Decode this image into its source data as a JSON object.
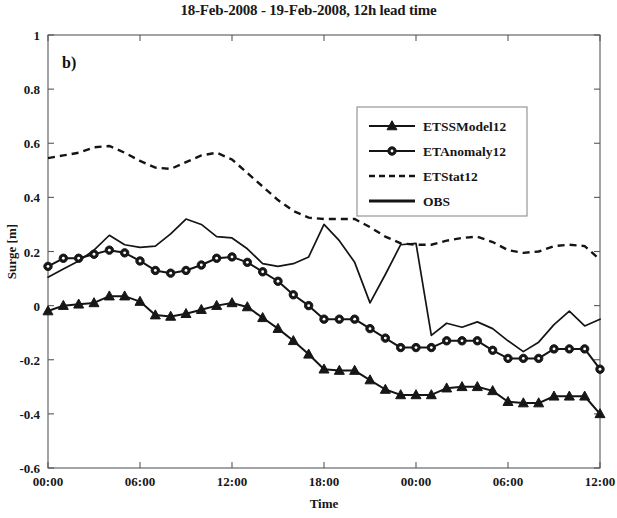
{
  "chart_data": {
    "type": "line",
    "title": "18-Feb-2008 - 19-Feb-2008, 12h lead time",
    "panel_label": "b)",
    "xlabel": "Time",
    "ylabel": "Surge [m]",
    "ylim": [
      -0.6,
      1.0
    ],
    "yticks": [
      -0.6,
      -0.4,
      -0.2,
      0,
      0.2,
      0.4,
      0.6,
      0.8,
      1
    ],
    "ytick_labels": [
      "-0.6",
      "-0.4",
      "-0.2",
      "0",
      "0.2",
      "0.4",
      "0.6",
      "0.8",
      "1"
    ],
    "xlim": [
      0,
      36
    ],
    "xticks": [
      0,
      6,
      12,
      18,
      24,
      30,
      36
    ],
    "xtick_labels": [
      "00:00",
      "06:00",
      "12:00",
      "18:00",
      "00:00",
      "06:00",
      "12:00"
    ],
    "grid": false,
    "legend_position": "upper-right-inset",
    "x": [
      0,
      1,
      2,
      3,
      4,
      5,
      6,
      7,
      8,
      9,
      10,
      11,
      12,
      13,
      14,
      15,
      16,
      17,
      18,
      19,
      20,
      21,
      22,
      23,
      24,
      25,
      26,
      27,
      28,
      29,
      30,
      31,
      32,
      33,
      34,
      35,
      36
    ],
    "series": [
      {
        "name": "ETSSModel12",
        "marker": "triangle",
        "style": "solid",
        "values": [
          -0.02,
          0.0,
          0.005,
          0.01,
          0.035,
          0.035,
          0.015,
          -0.035,
          -0.04,
          -0.03,
          -0.015,
          0.0,
          0.01,
          -0.005,
          -0.045,
          -0.085,
          -0.13,
          -0.18,
          -0.235,
          -0.24,
          -0.24,
          -0.275,
          -0.31,
          -0.33,
          -0.33,
          -0.33,
          -0.305,
          -0.3,
          -0.3,
          -0.315,
          -0.355,
          -0.36,
          -0.36,
          -0.335,
          -0.335,
          -0.335,
          -0.4
        ]
      },
      {
        "name": "ETAnomaly12",
        "marker": "circle",
        "style": "solid",
        "values": [
          0.145,
          0.175,
          0.175,
          0.19,
          0.205,
          0.195,
          0.165,
          0.13,
          0.12,
          0.13,
          0.15,
          0.175,
          0.18,
          0.16,
          0.125,
          0.09,
          0.04,
          0.0,
          -0.05,
          -0.05,
          -0.05,
          -0.085,
          -0.12,
          -0.155,
          -0.155,
          -0.155,
          -0.13,
          -0.13,
          -0.13,
          -0.165,
          -0.195,
          -0.195,
          -0.195,
          -0.16,
          -0.16,
          -0.16,
          -0.235
        ]
      },
      {
        "name": "ETStat12",
        "marker": "none",
        "style": "dashed",
        "values": [
          0.545,
          0.555,
          0.565,
          0.585,
          0.59,
          0.565,
          0.535,
          0.51,
          0.505,
          0.53,
          0.555,
          0.565,
          0.54,
          0.49,
          0.44,
          0.39,
          0.35,
          0.325,
          0.32,
          0.32,
          0.32,
          0.29,
          0.255,
          0.23,
          0.225,
          0.225,
          0.24,
          0.25,
          0.255,
          0.235,
          0.205,
          0.195,
          0.2,
          0.22,
          0.225,
          0.22,
          0.17
        ]
      },
      {
        "name": "OBS",
        "marker": "none",
        "style": "solid",
        "values": [
          0.105,
          0.135,
          0.165,
          0.205,
          0.26,
          0.225,
          0.215,
          0.22,
          0.265,
          0.32,
          0.3,
          0.255,
          0.25,
          0.21,
          0.155,
          0.145,
          0.155,
          0.18,
          0.3,
          0.24,
          0.16,
          0.01,
          0.115,
          0.225,
          0.23,
          -0.11,
          -0.065,
          -0.08,
          -0.06,
          -0.085,
          -0.13,
          -0.17,
          -0.135,
          -0.07,
          -0.02,
          -0.075,
          -0.05
        ]
      }
    ]
  },
  "legend": {
    "items": [
      {
        "label": "ETSSModel12",
        "marker": "triangle",
        "style": "solid"
      },
      {
        "label": "ETAnomaly12",
        "marker": "circle",
        "style": "solid"
      },
      {
        "label": "ETStat12",
        "marker": "none",
        "style": "dashed"
      },
      {
        "label": "OBS",
        "marker": "none",
        "style": "solid"
      }
    ]
  }
}
